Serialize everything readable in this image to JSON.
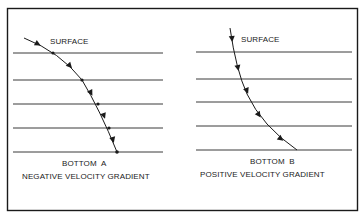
{
  "panels": [
    {
      "id": "a",
      "surface_label": "SURFACE",
      "bottom_label": "BOTTOM  A",
      "caption": "NEGATIVE VELOCITY GRADIENT",
      "layer_count": 5,
      "ray_description": "ray bends downward, becoming steeper with depth"
    },
    {
      "id": "b",
      "surface_label": "SURFACE",
      "bottom_label": "BOTTOM  B",
      "caption": "POSITIVE VELOCITY GRADIENT",
      "layer_count": 5,
      "ray_description": "ray bends toward horizontal with depth"
    }
  ],
  "colors": {
    "ink": "#1a1a1a",
    "lines": "#3a3a3a",
    "background": "#ffffff"
  }
}
